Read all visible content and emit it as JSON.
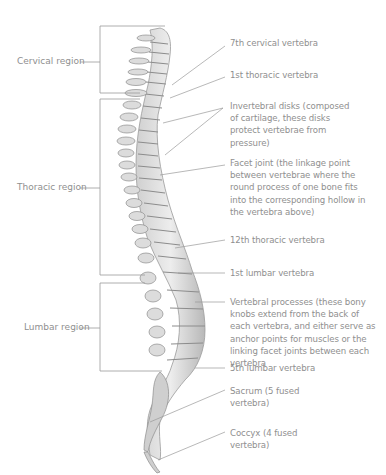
{
  "diagram": {
    "regions": [
      {
        "label": "Cervical region"
      },
      {
        "label": "Thoracic region"
      },
      {
        "label": "Lumbar region"
      }
    ],
    "labels": [
      {
        "text": "7th cervical vertebra"
      },
      {
        "text": "1st thoracic vertebra"
      },
      {
        "text": "Invertebral disks (composed of cartilage, these disks protect vertebrae from pressure)"
      },
      {
        "text": "Facet joint (the linkage point between vertebrae where the round process of one bone fits into the corresponding hollow in the vertebra above)"
      },
      {
        "text": "12th thoracic vertebra"
      },
      {
        "text": "1st lumbar vertebra"
      },
      {
        "text": "Vertebral processes (these bony knobs extend from the back of each vertebra, and either serve as anchor points for muscles or the linking facet joints between each vertebra"
      },
      {
        "text": "5th lumbar vertebra"
      },
      {
        "text": "Sacrum (5 fused vertebra)"
      },
      {
        "text": "Coccyx (4 fused vertebra)"
      }
    ],
    "colors": {
      "line": "#9a9a9a",
      "text": "#8f8f8f",
      "bone_light": "#e6e6e6",
      "bone_mid": "#bdbdbd",
      "bone_dark": "#8c8c8c"
    }
  }
}
